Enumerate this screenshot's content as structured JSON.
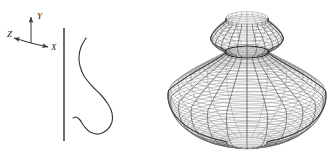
{
  "figure": {
    "kind": "surface-of-revolution-diagram",
    "background": "#ffffff",
    "ink": "#3a3a3a",
    "mesh_color": "#8a8a8a",
    "meridian_color": "#4a4a4a",
    "outline_color": "#2e2e2e"
  },
  "axes_triad": {
    "name": "coordinate-axes",
    "origin": [
      31,
      43
    ],
    "labels": {
      "y": "Y",
      "x": "X",
      "z": "Z"
    },
    "tips": {
      "y": [
        31,
        17
      ],
      "x": [
        48,
        47
      ],
      "z": [
        14,
        38
      ]
    }
  },
  "rotation_axis": {
    "name": "axis-of-revolution",
    "x": 64,
    "y_top": 28,
    "y_bottom": 141
  },
  "generatrix": {
    "name": "profile-curve",
    "description": "S-shaped generating curve rotated about the vertical axis",
    "points": [
      [
        86,
        38
      ],
      [
        81,
        47
      ],
      [
        79,
        57
      ],
      [
        80,
        66
      ],
      [
        84,
        76
      ],
      [
        92,
        86
      ],
      [
        101,
        95
      ],
      [
        108,
        104
      ],
      [
        112,
        113
      ],
      [
        112,
        122
      ],
      [
        107,
        130
      ],
      [
        99,
        134
      ],
      [
        90,
        132
      ],
      [
        84,
        126
      ],
      [
        80,
        120
      ],
      [
        76,
        117
      ],
      [
        73,
        118
      ]
    ]
  },
  "solid": {
    "name": "revolved-surface",
    "center_x": 247,
    "bulb": {
      "cx": 247,
      "cy": 96,
      "rx": 79,
      "ry": 47,
      "top_y": 49,
      "bottom_y": 143
    },
    "neck": {
      "cx": 247,
      "cy": 52,
      "rx": 22,
      "ry": 6
    },
    "dome": {
      "cx": 247,
      "cy": 36,
      "rx": 33,
      "ry": 21,
      "top_y": 18
    },
    "mesh": {
      "latitude_rings": 46,
      "meridian_lines": 24,
      "ellipse_flatten": 0.3
    }
  }
}
